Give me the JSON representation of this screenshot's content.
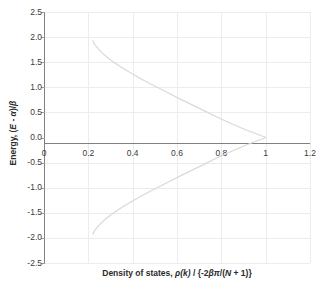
{
  "chart_data": {
    "type": "line",
    "title": "",
    "xlabel_parts": {
      "prefix": "Density of states, ",
      "rho": "ρ",
      "of_k": "(k)",
      "divider": " / {-2",
      "beta": "β",
      "pi": "π",
      "over": "/(",
      "N": "N",
      "plus_one": " + 1)}"
    },
    "xlabel": "Density of states, ρ(k) / {-2βπ/(N + 1)}",
    "ylabel": "Energy, (E - α)/β",
    "ylabel_parts": {
      "prefix": "Energy, (",
      "E": "E",
      "minus": " - ",
      "alpha": "α",
      "close": ")/",
      "beta": "β"
    },
    "xlim": [
      0,
      1.2
    ],
    "ylim": [
      -2.5,
      2.5
    ],
    "xticks": [
      0,
      0.2,
      0.4,
      0.6,
      0.8,
      1,
      1.2
    ],
    "xtick_labels": [
      "0",
      "0.2",
      "0.4",
      "0.6",
      "0.8",
      "1",
      "1.2"
    ],
    "yticks": [
      2.5,
      2.0,
      1.5,
      1.0,
      0.5,
      0.0,
      -0.5,
      -1.0,
      -1.5,
      -2.0,
      -2.5
    ],
    "ytick_labels": [
      "2.5",
      "2.0",
      "1.5",
      "1.0",
      "0.5",
      "0.0",
      "-0.5",
      "-1.0",
      "-1.5",
      "-2.0",
      "-2.5"
    ],
    "grid": true,
    "grid_color": "#ececec",
    "axis_color": "#808080",
    "series_color": "#d9d9d9",
    "legend": "none",
    "series": [
      {
        "name": "density of states",
        "x": [
          0.221,
          0.223,
          0.228,
          0.236,
          0.248,
          0.263,
          0.282,
          0.305,
          0.332,
          0.363,
          0.398,
          0.437,
          0.479,
          0.524,
          0.572,
          0.622,
          0.673,
          0.724,
          0.775,
          0.824,
          0.87,
          0.912,
          0.948,
          0.975,
          0.993,
          1.0,
          0.993,
          0.975,
          0.948,
          0.912,
          0.87,
          0.824,
          0.775,
          0.724,
          0.673,
          0.622,
          0.572,
          0.524,
          0.479,
          0.437,
          0.398,
          0.363,
          0.332,
          0.305,
          0.282,
          0.263,
          0.248,
          0.236,
          0.228,
          0.223,
          0.221
        ],
        "y": [
          1.93,
          1.9,
          1.86,
          1.81,
          1.75,
          1.68,
          1.61,
          1.53,
          1.45,
          1.36,
          1.27,
          1.17,
          1.07,
          0.97,
          0.86,
          0.75,
          0.64,
          0.53,
          0.42,
          0.32,
          0.23,
          0.15,
          0.09,
          0.045,
          0.015,
          0.0,
          -0.015,
          -0.045,
          -0.09,
          -0.15,
          -0.23,
          -0.32,
          -0.42,
          -0.53,
          -0.64,
          -0.75,
          -0.86,
          -0.97,
          -1.07,
          -1.17,
          -1.27,
          -1.36,
          -1.45,
          -1.53,
          -1.61,
          -1.68,
          -1.75,
          -1.81,
          -1.86,
          -1.9,
          -1.93
        ]
      }
    ]
  }
}
